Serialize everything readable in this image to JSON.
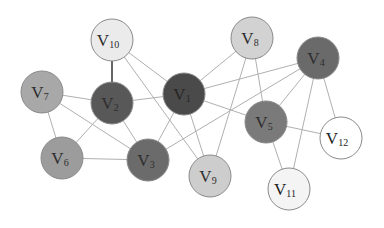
{
  "diagram": {
    "type": "undirected-graph",
    "nodes": [
      {
        "id": "v1",
        "label": "V",
        "sub": "1",
        "x": 184,
        "y": 94,
        "r": 21,
        "fill": "#4a4a4a",
        "text": "#262626"
      },
      {
        "id": "v2",
        "label": "V",
        "sub": "2",
        "x": 112,
        "y": 103,
        "r": 21,
        "fill": "#585858",
        "text": "#2e2e2e"
      },
      {
        "id": "v3",
        "label": "V",
        "sub": "3",
        "x": 148,
        "y": 160,
        "r": 21,
        "fill": "#6b6b6b",
        "text": "#2e2e2e"
      },
      {
        "id": "v4",
        "label": "V",
        "sub": "4",
        "x": 318,
        "y": 58,
        "r": 21,
        "fill": "#6a6a6a",
        "text": "#2e2e2e"
      },
      {
        "id": "v5",
        "label": "V",
        "sub": "5",
        "x": 266,
        "y": 122,
        "r": 21,
        "fill": "#7a7a7a",
        "text": "#2e2e2e"
      },
      {
        "id": "v6",
        "label": "V",
        "sub": "6",
        "x": 62,
        "y": 158,
        "r": 21,
        "fill": "#9c9c9c",
        "text": "#2e2e2e"
      },
      {
        "id": "v7",
        "label": "V",
        "sub": "7",
        "x": 42,
        "y": 92,
        "r": 21,
        "fill": "#a8a8a8",
        "text": "#2e2e2e"
      },
      {
        "id": "v8",
        "label": "V",
        "sub": "8",
        "x": 252,
        "y": 38,
        "r": 21,
        "fill": "#d2d2d2",
        "text": "#2e2e2e"
      },
      {
        "id": "v9",
        "label": "V",
        "sub": "9",
        "x": 210,
        "y": 176,
        "r": 21,
        "fill": "#cdcdcd",
        "text": "#2e2e2e"
      },
      {
        "id": "v10",
        "label": "V",
        "sub": "10",
        "x": 112,
        "y": 40,
        "r": 21,
        "fill": "#ebebeb",
        "text": "#2e2e2e"
      },
      {
        "id": "v11",
        "label": "V",
        "sub": "11",
        "x": 289,
        "y": 189,
        "r": 21,
        "fill": "#f4f4f4",
        "text": "#1e1e1e"
      },
      {
        "id": "v12",
        "label": "V",
        "sub": "12",
        "x": 341,
        "y": 138,
        "r": 21,
        "fill": "#ffffff",
        "text": "#1e1e1e"
      }
    ],
    "edges": [
      {
        "from": "v10",
        "to": "v2",
        "color": "#555555",
        "width": 1.8
      },
      {
        "from": "v10",
        "to": "v1",
        "color": "#b0b0b0",
        "width": 1
      },
      {
        "from": "v10",
        "to": "v9",
        "color": "#b0b0b0",
        "width": 1
      },
      {
        "from": "v7",
        "to": "v2",
        "color": "#b0b0b0",
        "width": 1
      },
      {
        "from": "v7",
        "to": "v6",
        "color": "#b0b0b0",
        "width": 1
      },
      {
        "from": "v7",
        "to": "v3",
        "color": "#b0b0b0",
        "width": 1
      },
      {
        "from": "v2",
        "to": "v1",
        "color": "#b0b0b0",
        "width": 1
      },
      {
        "from": "v2",
        "to": "v6",
        "color": "#b0b0b0",
        "width": 1
      },
      {
        "from": "v2",
        "to": "v3",
        "color": "#b0b0b0",
        "width": 1
      },
      {
        "from": "v1",
        "to": "v8",
        "color": "#b0b0b0",
        "width": 1
      },
      {
        "from": "v1",
        "to": "v4",
        "color": "#b0b0b0",
        "width": 1
      },
      {
        "from": "v1",
        "to": "v3",
        "color": "#b0b0b0",
        "width": 1
      },
      {
        "from": "v1",
        "to": "v9",
        "color": "#b0b0b0",
        "width": 1
      },
      {
        "from": "v1",
        "to": "v5",
        "color": "#b0b0b0",
        "width": 1
      },
      {
        "from": "v8",
        "to": "v9",
        "color": "#b0b0b0",
        "width": 1
      },
      {
        "from": "v8",
        "to": "v5",
        "color": "#b0b0b0",
        "width": 1
      },
      {
        "from": "v4",
        "to": "v3",
        "color": "#b0b0b0",
        "width": 1
      },
      {
        "from": "v4",
        "to": "v5",
        "color": "#b0b0b0",
        "width": 1
      },
      {
        "from": "v4",
        "to": "v11",
        "color": "#b0b0b0",
        "width": 1
      },
      {
        "from": "v4",
        "to": "v12",
        "color": "#b0b0b0",
        "width": 1
      },
      {
        "from": "v5",
        "to": "v12",
        "color": "#b0b0b0",
        "width": 1
      },
      {
        "from": "v5",
        "to": "v11",
        "color": "#b0b0b0",
        "width": 1
      },
      {
        "from": "v6",
        "to": "v3",
        "color": "#b0b0b0",
        "width": 1
      }
    ],
    "node_stroke": "#8a8a8a"
  }
}
